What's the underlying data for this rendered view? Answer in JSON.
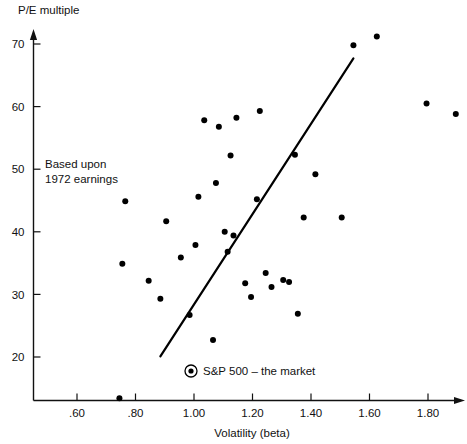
{
  "chart_data": {
    "type": "scatter",
    "title": "",
    "xlabel": "Volatility (beta)",
    "ylabel": "P/E multiple",
    "xlim": [
      0.45,
      1.96
    ],
    "ylim": [
      8.5,
      75
    ],
    "grid": false,
    "legend_position": "inside-bottom-left",
    "xticks": [
      0.6,
      0.8,
      1.0,
      1.2,
      1.4,
      1.6,
      1.8
    ],
    "xtick_labels": [
      ".60",
      ".80",
      "1.00",
      "1.20",
      "1.40",
      "1.60",
      "1.80"
    ],
    "yticks": [
      20,
      30,
      40,
      50,
      60,
      70
    ],
    "ytick_labels": [
      "20",
      "30",
      "40",
      "50",
      "60",
      "70"
    ],
    "annotation_lines": [
      "Based upon",
      "1972 earnings"
    ],
    "legend_entries": [
      {
        "marker": "circled-dot",
        "label": "S&P 500 – the market"
      }
    ],
    "trend_line": {
      "x0": 0.885,
      "y0": 20.1,
      "x1": 1.545,
      "y1": 67.7
    },
    "points": [
      {
        "x": 0.745,
        "y": 13.4
      },
      {
        "x": 0.755,
        "y": 34.9
      },
      {
        "x": 0.765,
        "y": 44.9
      },
      {
        "x": 0.845,
        "y": 32.2
      },
      {
        "x": 0.885,
        "y": 29.3
      },
      {
        "x": 0.905,
        "y": 41.7
      },
      {
        "x": 0.955,
        "y": 35.9
      },
      {
        "x": 0.985,
        "y": 26.7
      },
      {
        "x": 1.005,
        "y": 37.9
      },
      {
        "x": 1.015,
        "y": 45.6
      },
      {
        "x": 1.035,
        "y": 57.8
      },
      {
        "x": 1.065,
        "y": 22.7
      },
      {
        "x": 1.075,
        "y": 47.8
      },
      {
        "x": 1.085,
        "y": 56.8
      },
      {
        "x": 1.105,
        "y": 40.0
      },
      {
        "x": 1.115,
        "y": 36.8
      },
      {
        "x": 1.125,
        "y": 52.2
      },
      {
        "x": 1.135,
        "y": 39.4
      },
      {
        "x": 1.145,
        "y": 58.2
      },
      {
        "x": 1.175,
        "y": 31.8
      },
      {
        "x": 1.195,
        "y": 29.6
      },
      {
        "x": 1.215,
        "y": 45.2
      },
      {
        "x": 1.225,
        "y": 59.3
      },
      {
        "x": 1.245,
        "y": 33.4
      },
      {
        "x": 1.265,
        "y": 31.2
      },
      {
        "x": 1.305,
        "y": 32.3
      },
      {
        "x": 1.325,
        "y": 32.0
      },
      {
        "x": 1.345,
        "y": 52.3
      },
      {
        "x": 1.355,
        "y": 26.9
      },
      {
        "x": 1.375,
        "y": 42.3
      },
      {
        "x": 1.415,
        "y": 49.2
      },
      {
        "x": 1.505,
        "y": 42.3
      },
      {
        "x": 1.545,
        "y": 69.8
      },
      {
        "x": 1.625,
        "y": 71.2
      },
      {
        "x": 1.795,
        "y": 60.5
      },
      {
        "x": 1.895,
        "y": 58.8
      }
    ]
  }
}
